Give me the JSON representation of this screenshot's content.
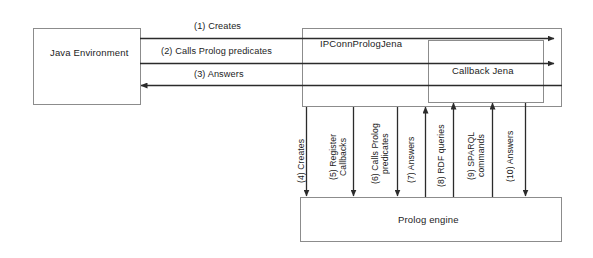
{
  "diagram": {
    "background_color": "#ffffff",
    "line_color": "#2b2b2b",
    "text_color": "#1c1c1c"
  },
  "boxes": {
    "java_environment": {
      "label": "Java Environment"
    },
    "ipconn": {
      "label": "IPConnPrologJena"
    },
    "callback": {
      "label": "Callback Jena"
    },
    "prolog_engine": {
      "label": "Prolog engine"
    }
  },
  "horizontal_messages": [
    {
      "id": 1,
      "label": "(1) Creates",
      "direction": "right"
    },
    {
      "id": 2,
      "label": "(2) Calls Prolog predicates",
      "direction": "right"
    },
    {
      "id": 3,
      "label": "(3) Answers",
      "direction": "left"
    }
  ],
  "vertical_messages": [
    {
      "id": 4,
      "label": "(4) Creates",
      "direction": "down"
    },
    {
      "id": 5,
      "label": "(5) Register\nCallbacks",
      "direction": "down"
    },
    {
      "id": 6,
      "label": "(6) Calls Prolog\npredicates",
      "direction": "down"
    },
    {
      "id": 7,
      "label": "(7) Answers",
      "direction": "up"
    },
    {
      "id": 8,
      "label": "(8) RDF queries",
      "direction": "up"
    },
    {
      "id": 9,
      "label": "(9) SPARQL\ncommands",
      "direction": "up"
    },
    {
      "id": 10,
      "label": "(10) Answers",
      "direction": "down"
    }
  ]
}
